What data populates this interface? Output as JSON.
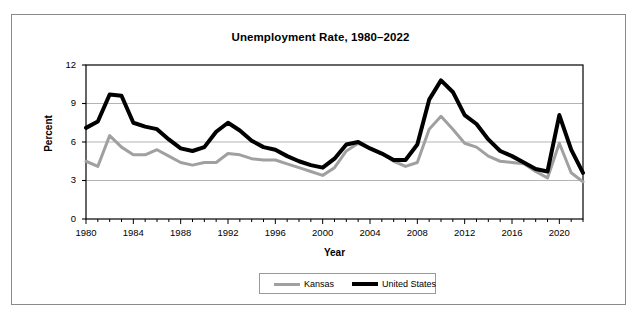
{
  "chart_data": {
    "type": "line",
    "title": "Unemployment Rate, 1980–2022",
    "xlabel": "Year",
    "ylabel": "Percent",
    "xlim": [
      1980,
      2022
    ],
    "ylim": [
      0,
      12
    ],
    "yticks": [
      "0",
      "3",
      "6",
      "9",
      "12"
    ],
    "ytick_values": [
      0,
      3,
      6,
      9,
      12
    ],
    "xticks": [
      "1980",
      "1984",
      "1988",
      "1992",
      "1996",
      "2000",
      "2004",
      "2008",
      "2012",
      "2016",
      "2020"
    ],
    "xtick_values": [
      1980,
      1984,
      1988,
      1992,
      1996,
      2000,
      2004,
      2008,
      2012,
      2016,
      2020
    ],
    "x": [
      1980,
      1981,
      1982,
      1983,
      1984,
      1985,
      1986,
      1987,
      1988,
      1989,
      1990,
      1991,
      1992,
      1993,
      1994,
      1995,
      1996,
      1997,
      1998,
      1999,
      2000,
      2001,
      2002,
      2003,
      2004,
      2005,
      2006,
      2007,
      2008,
      2009,
      2010,
      2011,
      2012,
      2013,
      2014,
      2015,
      2016,
      2017,
      2018,
      2019,
      2020,
      2021,
      2022
    ],
    "grid": true,
    "grid_axis": "y",
    "legend_position": "bottom",
    "series": [
      {
        "name": "Kansas",
        "color": "#a0a0a0",
        "width": 3,
        "values": [
          4.5,
          4.1,
          6.5,
          5.6,
          5.0,
          5.0,
          5.4,
          4.9,
          4.4,
          4.2,
          4.4,
          4.4,
          5.1,
          5.0,
          4.7,
          4.6,
          4.6,
          4.3,
          4.0,
          3.7,
          3.4,
          4.0,
          5.3,
          5.9,
          5.5,
          5.1,
          4.5,
          4.1,
          4.4,
          7.0,
          8.0,
          7.0,
          5.9,
          5.6,
          4.9,
          4.5,
          4.4,
          4.3,
          3.7,
          3.2,
          5.9,
          3.6,
          2.9
        ]
      },
      {
        "name": "United States",
        "color": "#000000",
        "width": 4,
        "values": [
          7.1,
          7.6,
          9.7,
          9.6,
          7.5,
          7.2,
          7.0,
          6.2,
          5.5,
          5.3,
          5.6,
          6.8,
          7.5,
          6.9,
          6.1,
          5.6,
          5.4,
          4.9,
          4.5,
          4.2,
          4.0,
          4.7,
          5.8,
          6.0,
          5.5,
          5.1,
          4.6,
          4.6,
          5.8,
          9.3,
          10.8,
          9.9,
          8.1,
          7.4,
          6.2,
          5.3,
          4.9,
          4.4,
          3.9,
          3.7,
          8.1,
          5.4,
          3.6
        ]
      }
    ]
  },
  "legend": {
    "items": [
      {
        "label": "Kansas"
      },
      {
        "label": "United States"
      }
    ]
  }
}
